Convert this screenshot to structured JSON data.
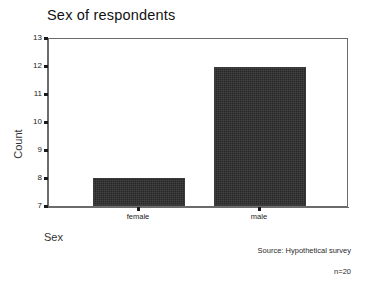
{
  "chart_data": {
    "type": "bar",
    "title": "Sex of respondents",
    "xlabel": "Sex",
    "ylabel": "Count",
    "categories": [
      "female",
      "male"
    ],
    "values": [
      8,
      12
    ],
    "ylim": [
      7,
      13
    ],
    "yticks": [
      7,
      8,
      9,
      10,
      11,
      12,
      13
    ],
    "ytick_labels": [
      "7",
      "8",
      "9",
      "10",
      "11",
      "12",
      "13"
    ],
    "grid": false,
    "legend": null,
    "bar_color": "#262626",
    "axis_color": "#6b6b6b",
    "background_color": "#ffffff",
    "annotations": [
      "Source: Hypothetical survey",
      "n=20"
    ]
  },
  "footer": {
    "source": "Source: Hypothetical survey",
    "sample_size": "n=20"
  }
}
